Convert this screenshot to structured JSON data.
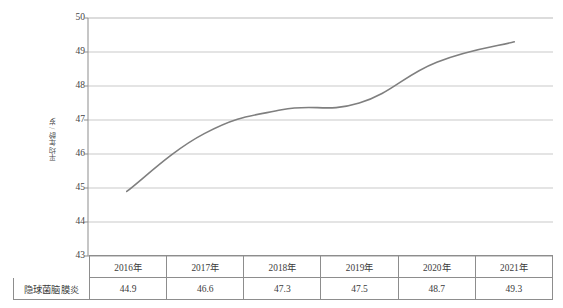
{
  "chart_data": {
    "type": "line",
    "title": "",
    "subtitle": "",
    "xlabel": "",
    "ylabel": "平均年龄 / 岁",
    "categories": [
      "2016年",
      "2017年",
      "2018年",
      "2019年",
      "2020年",
      "2021年"
    ],
    "series": [
      {
        "name": "隐球菌脑膜炎",
        "values": [
          44.9,
          46.6,
          47.3,
          47.5,
          48.7,
          49.3
        ],
        "color": "#7f7f7f"
      }
    ],
    "ylim": [
      43,
      50
    ],
    "yticks": [
      50,
      49,
      48,
      47,
      46,
      45,
      44,
      43
    ],
    "ytick_labels": [
      "50",
      "49",
      "48",
      "47",
      "46",
      "45",
      "44",
      "43"
    ],
    "grid": "horizontal",
    "grid_color": "#c9c9c9",
    "legend": "none",
    "legend_position": "none",
    "axis_color": "#8d8d8d"
  },
  "table": {
    "corner_label": "",
    "header": [
      "2016年",
      "2017年",
      "2018年",
      "2019年",
      "2020年",
      "2021年"
    ],
    "rows": [
      {
        "label": "隐球菌脑膜炎",
        "cells": [
          "44.9",
          "46.6",
          "47.3",
          "47.5",
          "48.7",
          "49.3"
        ]
      }
    ]
  }
}
